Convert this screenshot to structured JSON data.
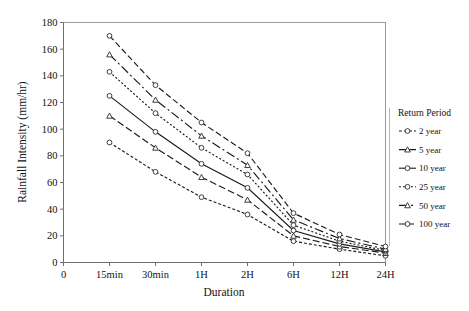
{
  "chart_data": {
    "type": "line",
    "title": "",
    "xlabel": "Duration",
    "ylabel": "Rainfall Intensity (mm/hr)",
    "categories": [
      "15min",
      "30min",
      "1H",
      "2H",
      "6H",
      "12H",
      "24H"
    ],
    "xtick_labels": [
      "0",
      "15min",
      "30min",
      "1H",
      "2H",
      "6H",
      "12H",
      "24H"
    ],
    "ytick_labels": [
      "0",
      "20",
      "40",
      "60",
      "80",
      "100",
      "120",
      "140",
      "160",
      "180"
    ],
    "ylim": [
      0,
      180
    ],
    "ystep": 20,
    "grid": false,
    "legend_position": "right",
    "legend_title": "Return Period",
    "series": [
      {
        "name": "2 year",
        "marker": "circle",
        "dash": "3,2",
        "values": [
          90,
          68,
          49,
          36,
          16,
          10,
          5
        ]
      },
      {
        "name": "5 year",
        "marker": "triangle",
        "dash": "7,3",
        "values": [
          110,
          86,
          64,
          47,
          20,
          12,
          7
        ]
      },
      {
        "name": "10 year",
        "marker": "circle",
        "dash": "none",
        "values": [
          125,
          98,
          74,
          56,
          24,
          14,
          8
        ]
      },
      {
        "name": "25 year",
        "marker": "circle",
        "dash": "2,2",
        "values": [
          143,
          112,
          86,
          66,
          28,
          16,
          9
        ]
      },
      {
        "name": "50 year",
        "marker": "triangle",
        "dash": "9,3,2,3",
        "values": [
          156,
          122,
          95,
          73,
          32,
          18,
          10
        ]
      },
      {
        "name": "100 year",
        "marker": "circle",
        "dash": "6,3",
        "values": [
          170,
          133,
          105,
          82,
          37,
          21,
          12
        ]
      }
    ]
  },
  "axes": {
    "xlabel": "Duration",
    "ylabel": "Rainfall Intensity (mm/hr)"
  },
  "legend": {
    "title": "Return Period",
    "entries": [
      {
        "label": "2 year"
      },
      {
        "label": "5 year"
      },
      {
        "label": "10 year"
      },
      {
        "label": "25 year"
      },
      {
        "label": "50 year"
      },
      {
        "label": "100 year"
      }
    ]
  },
  "colors": {
    "line": "#1b1b1b",
    "frame": "#9a9a9a",
    "text": "#111111",
    "background": "#ffffff"
  }
}
